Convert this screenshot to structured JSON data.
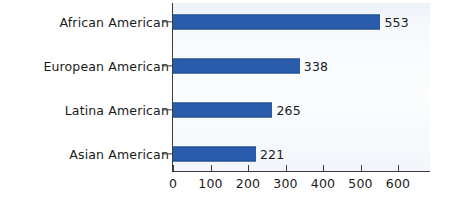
{
  "chart_data": {
    "type": "bar",
    "orientation": "horizontal",
    "title": "",
    "subtitle": "",
    "xlabel": "",
    "ylabel": "",
    "categories": [
      "African American",
      "European American",
      "Latina American",
      "Asian American"
    ],
    "values": [
      553,
      338,
      265,
      221
    ],
    "value_labels": [
      "553",
      "338",
      "265",
      "221"
    ],
    "xlim": [
      0,
      680
    ],
    "x_ticks": [
      0,
      100,
      200,
      300,
      400,
      500,
      600
    ],
    "x_tick_labels": [
      "0",
      "100",
      "200",
      "300",
      "400",
      "500",
      "600"
    ],
    "grid": false,
    "legend": null,
    "series": [
      {
        "name": "",
        "values": [
          553,
          338,
          265,
          221
        ]
      }
    ],
    "colors": {
      "bar": "#2b5cab",
      "bar_edge": "#1f4a92",
      "axis": "#3a3a3a",
      "text": "#1b1b1b",
      "plot_background": "#f7fafd",
      "page_background": "#ffffff"
    }
  },
  "rows": [
    {
      "label": "African American",
      "value": 553,
      "value_text": "553",
      "center_y": 22
    },
    {
      "label": "European American",
      "value": 338,
      "value_text": "338",
      "center_y": 66
    },
    {
      "label": "Latina American",
      "value": 265,
      "value_text": "265",
      "center_y": 110
    },
    {
      "label": "Asian American",
      "value": 221,
      "value_text": "221",
      "center_y": 154
    }
  ],
  "x_axis": {
    "ticks": [
      {
        "label": "0",
        "value": 0
      },
      {
        "label": "100",
        "value": 100
      },
      {
        "label": "200",
        "value": 200
      },
      {
        "label": "300",
        "value": 300
      },
      {
        "label": "400",
        "value": 400
      },
      {
        "label": "500",
        "value": 500
      },
      {
        "label": "600",
        "value": 600
      }
    ]
  }
}
